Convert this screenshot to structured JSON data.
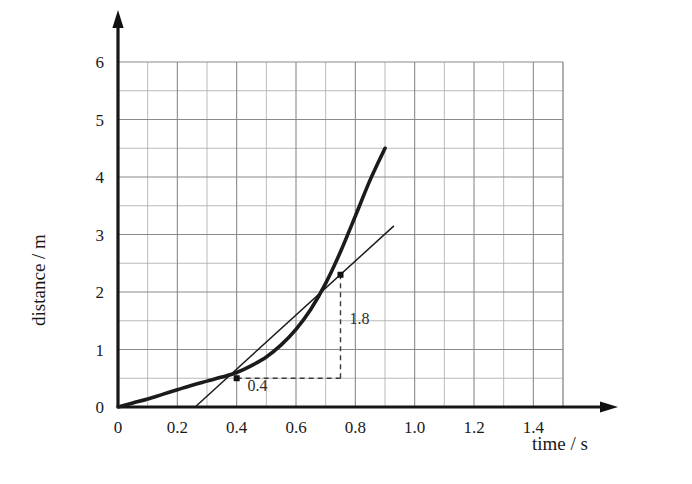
{
  "chart_data": {
    "type": "line",
    "title": "",
    "xlabel": "time / s",
    "ylabel": "distance / m",
    "xlim": [
      0,
      1.55
    ],
    "ylim": [
      0,
      6.45
    ],
    "grid": true,
    "grid_major_x_step": 0.2,
    "grid_minor_x_step": 0.1,
    "grid_major_y_step": 1,
    "grid_minor_y_step": 0.5,
    "legend": "none",
    "xticks": [
      "0",
      "0.2",
      "0.4",
      "0.6",
      "0.8",
      "1.0",
      "1.2",
      "1.4"
    ],
    "xtick_values": [
      0,
      0.2,
      0.4,
      0.6,
      0.8,
      1.0,
      1.2,
      1.4
    ],
    "yticks": [
      "0",
      "1",
      "2",
      "3",
      "4",
      "5",
      "6"
    ],
    "ytick_values": [
      0,
      1,
      2,
      3,
      4,
      5,
      6
    ],
    "series": [
      {
        "name": "distance-time curve",
        "style": "thick-solid",
        "x": [
          0.0,
          0.05,
          0.1,
          0.15,
          0.2,
          0.25,
          0.3,
          0.35,
          0.4,
          0.45,
          0.5,
          0.55,
          0.6,
          0.65,
          0.7,
          0.75,
          0.8,
          0.85,
          0.9
        ],
        "y": [
          0.0,
          0.07,
          0.14,
          0.22,
          0.3,
          0.38,
          0.45,
          0.52,
          0.6,
          0.72,
          0.87,
          1.08,
          1.35,
          1.7,
          2.15,
          2.7,
          3.32,
          3.95,
          4.5
        ]
      },
      {
        "name": "tangent line at t = 0.6 s",
        "style": "thin-solid",
        "x": [
          0.26,
          0.93
        ],
        "y": [
          0.0,
          3.15
        ]
      }
    ],
    "annotations": [
      {
        "name": "run-label",
        "text": "0.4",
        "x": 0.47,
        "y": 0.28
      },
      {
        "name": "rise-label",
        "text": "1.8",
        "x": 0.78,
        "y": 1.45
      }
    ],
    "construction": {
      "run_start": {
        "x": 0.4,
        "y": 0.5
      },
      "run_end": {
        "x": 0.75,
        "y": 0.5
      },
      "rise_top": {
        "x": 0.75,
        "y": 2.3
      },
      "markers": [
        {
          "name": "lower-tangent-point",
          "x": 0.4,
          "y": 0.5
        },
        {
          "name": "upper-tangent-point",
          "x": 0.75,
          "y": 2.3
        }
      ]
    },
    "axis_arrows": {
      "x": true,
      "y": true
    }
  },
  "axes": {
    "x_title": "time / s",
    "y_title": "distance / m"
  },
  "colors": {
    "curve": "#1b1b1b",
    "tangent": "#1b1b1b",
    "grid_major": "#8a8a8a",
    "grid_minor": "#a8a8a8",
    "axis": "#161616",
    "background": "#ffffff",
    "dashed": "#3a3a3a"
  }
}
